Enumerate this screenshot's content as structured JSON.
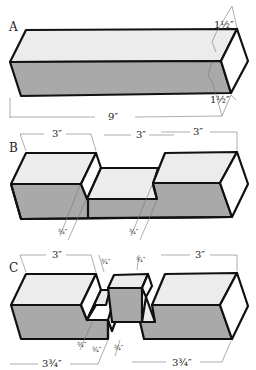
{
  "figures": [
    {
      "label": "A",
      "description": "Full block",
      "dimensions": {
        "length": "9″",
        "height": "1½″",
        "depth": "1½″"
      }
    },
    {
      "label": "B",
      "description": "Block with center notch cut",
      "dimensions": {
        "left_length": "3″",
        "center_length": "3″",
        "right_length": "3″",
        "notch_depth_left": "¾″",
        "notch_depth_right": "¾″"
      }
    },
    {
      "label": "C",
      "description": "Block split into pieces with interlocking joint",
      "dimensions": {
        "left_length": "3″",
        "right_length": "3″",
        "left_total": "3¾″",
        "right_total": "3¾″",
        "tenon_a": "¾″",
        "tenon_b": "¾″",
        "tenon_c": "¾″",
        "tenon_d": "¾″",
        "tenon_e": "¾″"
      }
    }
  ],
  "colors": {
    "top_face": "#ececec",
    "front_face": "#a9a9a9",
    "end_face": "#ffffff",
    "outline": "#111111",
    "dimension_line": "#777777"
  }
}
